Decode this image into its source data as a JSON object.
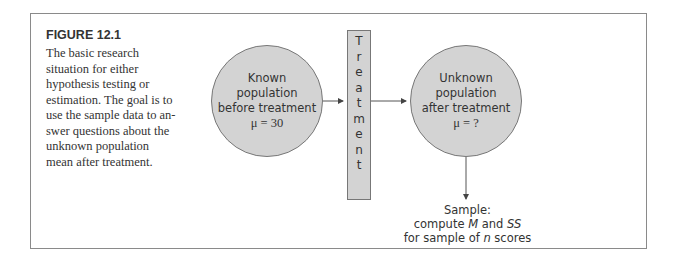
{
  "figure": {
    "title": "FIGURE 12.1",
    "caption": "The basic research situation for either hypothesis testing or estimation. The goal is to use the sample data to an-swer questions about the unknown population mean after treatment."
  },
  "diagram": {
    "known": {
      "line1": "Known",
      "line2": "population",
      "line3": "before treatment",
      "mu": "μ = 30"
    },
    "treatment": {
      "letters": [
        "T",
        "r",
        "e",
        "a",
        "t",
        "m",
        "e",
        "n",
        "t"
      ]
    },
    "unknown": {
      "line1": "Unknown",
      "line2": "population",
      "line3": "after treatment",
      "mu": "μ = ?"
    },
    "sample": {
      "line1": "Sample:",
      "line2_a": "compute ",
      "M": "M",
      "line2_b": " and ",
      "SS": "SS",
      "line3_a": "for sample of ",
      "n": "n",
      "line3_b": " scores"
    }
  }
}
